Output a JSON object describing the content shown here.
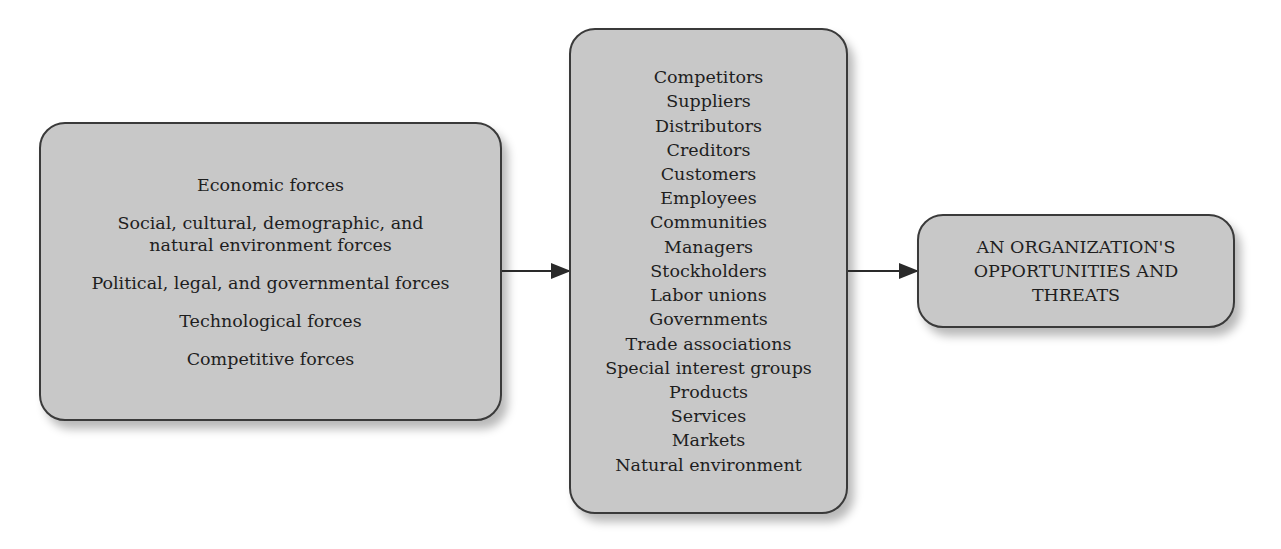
{
  "diagram": {
    "forces_box": {
      "items": [
        "Economic forces",
        "Social, cultural, demographic, and natural environment forces",
        "Political, legal, and governmental forces",
        "Technological forces",
        "Competitive forces"
      ],
      "item_lines": [
        [
          "Economic forces"
        ],
        [
          "Social, cultural, demographic, and",
          "natural environment forces"
        ],
        [
          "Political, legal, and governmental forces"
        ],
        [
          "Technological forces"
        ],
        [
          "Competitive forces"
        ]
      ]
    },
    "stakeholders_box": {
      "items": [
        "Competitors",
        "Suppliers",
        "Distributors",
        "Creditors",
        "Customers",
        "Employees",
        "Communities",
        "Managers",
        "Stockholders",
        "Labor unions",
        "Governments",
        "Trade associations",
        "Special interest groups",
        "Products",
        "Services",
        "Markets",
        "Natural environment"
      ]
    },
    "outcome_box": {
      "text": "AN ORGANIZATION'S OPPORTUNITIES AND THREATS",
      "lines": [
        "AN ORGANIZATION'S",
        "OPPORTUNITIES AND",
        "THREATS"
      ]
    },
    "connections": [
      {
        "from": "forces_box",
        "to": "stakeholders_box"
      },
      {
        "from": "stakeholders_box",
        "to": "outcome_box"
      }
    ],
    "colors": {
      "box_fill": "#c8c8c8",
      "box_border": "#3a3a3a",
      "arrow": "#2a2a2a",
      "background": "#ffffff"
    }
  }
}
